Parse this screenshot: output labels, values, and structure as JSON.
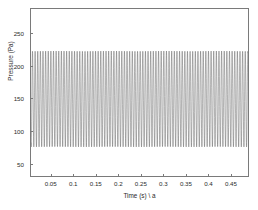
{
  "figure": {
    "background_color": "#ffffff",
    "axis_color": "#7a7a7a",
    "line_color": "#555555"
  },
  "axes": {
    "x_title": "Time (s) \\ a",
    "y_title": "Pressure (Pa)",
    "x_ticks": [
      "0.05",
      "0.1",
      "0.15",
      "0.2",
      "0.25",
      "0.3",
      "0.35",
      "0.4",
      "0.45"
    ],
    "y_ticks": [
      "50",
      "100",
      "150",
      "200",
      "250"
    ]
  },
  "chart_data": {
    "type": "line",
    "title": "",
    "subtitle": "",
    "xlabel": "Time (s) \\ a",
    "ylabel": "Pressure (Pa)",
    "xlim": [
      0.004,
      0.49
    ],
    "ylim": [
      30,
      288
    ],
    "xticks": [
      0.05,
      0.1,
      0.15,
      0.2,
      0.25,
      0.3,
      0.35,
      0.4,
      0.45
    ],
    "yticks": [
      50,
      100,
      150,
      200,
      250
    ],
    "grid": false,
    "legend": null,
    "legend_position": "none",
    "annotations": [],
    "series": [
      {
        "name": "pressure",
        "color": "#555555",
        "line_width": 0.5,
        "description": "Dense high-frequency sinusoidal pressure oscillation of roughly constant amplitude across the whole record.",
        "waveform": {
          "model": "sinusoid",
          "mean_pa": 149,
          "amplitude_pa": 74,
          "peak_pa": 223,
          "trough_pa": 75,
          "frequency_hz": 170,
          "phase_rad": 0.0,
          "sample_count": 2400,
          "t_start_s": 0.004,
          "t_end_s": 0.49
        }
      }
    ]
  }
}
